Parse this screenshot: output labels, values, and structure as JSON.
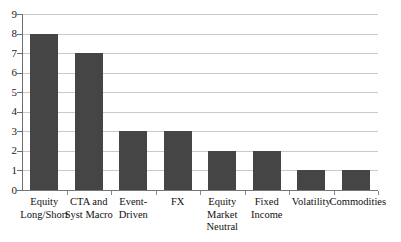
{
  "chart_data": {
    "type": "bar",
    "title": "",
    "subtitle": "",
    "xlabel": "",
    "ylabel": "",
    "categories": [
      "Equity Long/Short",
      "CTA and Syst Macro",
      "Event-Driven",
      "FX",
      "Equity Market Neutral",
      "Fixed Income",
      "Volatility",
      "Commodities"
    ],
    "category_lines": [
      [
        "Equity",
        "Long/Short"
      ],
      [
        "CTA and",
        "Syst Macro"
      ],
      [
        "Event-Driven"
      ],
      [
        "FX"
      ],
      [
        "Equity",
        "Market",
        "Neutral"
      ],
      [
        "Fixed",
        "Income"
      ],
      [
        "Volatility"
      ],
      [
        "Commodities"
      ]
    ],
    "values": [
      8,
      7,
      3,
      3,
      2,
      2,
      1,
      1
    ],
    "ylim": [
      0,
      9
    ],
    "ytick_step": 1,
    "ytick_labels": [
      "0",
      "1",
      "2",
      "3",
      "4",
      "5",
      "6",
      "7",
      "8",
      "9"
    ],
    "grid": true,
    "grid_axis": "y",
    "legend": false,
    "legend_position": "none",
    "bar_color": "#454545",
    "grid_color": "#c9c9c9",
    "axis_color": "#6e6e6e",
    "background_color": "#ffffff",
    "text_color": "#101010"
  }
}
